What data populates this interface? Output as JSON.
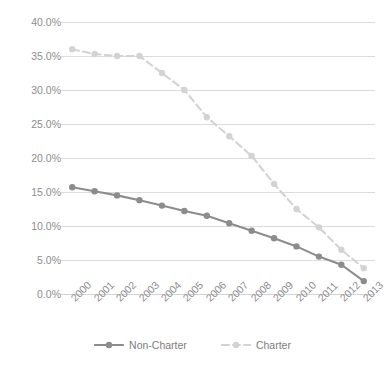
{
  "chart_data": {
    "type": "line",
    "title": "",
    "xlabel": "",
    "ylabel": "",
    "categories": [
      "2000",
      "2001",
      "2002",
      "2003",
      "2004",
      "2005",
      "2006",
      "2007",
      "2008",
      "2009",
      "2010",
      "2011",
      "2012",
      "2013"
    ],
    "ylim": [
      0,
      40
    ],
    "ytick_labels": [
      "0.0%",
      "5.0%",
      "10.0%",
      "15.0%",
      "20.0%",
      "25.0%",
      "30.0%",
      "35.0%",
      "40.0%"
    ],
    "ytick_values": [
      0,
      5,
      10,
      15,
      20,
      25,
      30,
      35,
      40
    ],
    "grid": true,
    "legend_position": "bottom",
    "series": [
      {
        "name": "Non-Charter",
        "color": "#8c8c8c",
        "marker": "circle",
        "line_style": "solid",
        "values": [
          15.7,
          15.1,
          14.5,
          13.8,
          13.0,
          12.2,
          11.5,
          10.4,
          9.3,
          8.2,
          7.0,
          5.5,
          4.3,
          1.9
        ]
      },
      {
        "name": "Charter",
        "color": "#d3d3d3",
        "marker": "circle",
        "line_style": "dashed",
        "values": [
          36.0,
          35.3,
          35.0,
          35.0,
          32.5,
          30.0,
          26.0,
          23.2,
          20.3,
          16.2,
          12.5,
          9.8,
          6.5,
          3.8
        ]
      }
    ]
  },
  "legend": {
    "items": [
      {
        "label": "Non-Charter",
        "color": "#8c8c8c"
      },
      {
        "label": "Charter",
        "color": "#d3d3d3"
      }
    ]
  },
  "colors": {
    "non_charter": "#8c8c8c",
    "charter": "#d3d3d3",
    "gridline": "#dcdcdc",
    "axis_text": "#8d8d8d",
    "background": "#ffffff"
  }
}
